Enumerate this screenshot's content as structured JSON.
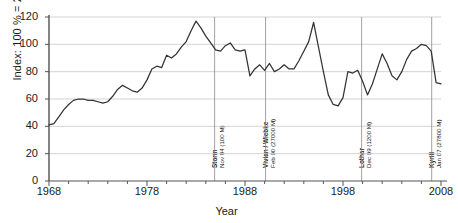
{
  "chart_data": {
    "type": "line",
    "title": "",
    "xlabel": "Year",
    "ylabel": "Index: 100 % = 2010",
    "xlim": [
      1968,
      2008
    ],
    "ylim": [
      0,
      120
    ],
    "grid": true,
    "legend": "none",
    "yticks": [
      0,
      20,
      40,
      60,
      80,
      100,
      120
    ],
    "xticks": [
      1968,
      1978,
      1988,
      1998,
      2008
    ],
    "x_minor_tick_step": 2,
    "series": [
      {
        "name": "Index",
        "x": [
          1968,
          1968.5,
          1969,
          1969.5,
          1970,
          1970.5,
          1971,
          1971.5,
          1972,
          1972.5,
          1973,
          1973.5,
          1974,
          1974.5,
          1975,
          1975.5,
          1976,
          1976.5,
          1977,
          1977.5,
          1978,
          1978.5,
          1979,
          1979.5,
          1980,
          1980.5,
          1981,
          1981.5,
          1982,
          1982.5,
          1983,
          1983.5,
          1984,
          1984.5,
          1985,
          1985.5,
          1986,
          1986.5,
          1987,
          1987.5,
          1988,
          1988.5,
          1989,
          1989.5,
          1990,
          1990.5,
          1991,
          1991.5,
          1992,
          1992.5,
          1993,
          1993.5,
          1994,
          1994.5,
          1995,
          1995.5,
          1996,
          1996.5,
          1997,
          1997.5,
          1998,
          1998.5,
          1999,
          1999.5,
          2000,
          2000.5,
          2001,
          2001.5,
          2002,
          2002.5,
          2003,
          2003.5,
          2004,
          2004.5,
          2005,
          2005.5,
          2006,
          2006.5,
          2007,
          2007.5,
          2008
        ],
        "y": [
          41,
          42,
          47,
          52,
          56,
          59,
          60,
          60,
          59,
          59,
          58,
          57,
          58,
          62,
          67,
          70,
          68,
          66,
          65,
          68,
          74,
          82,
          84,
          83,
          92,
          90,
          93,
          98,
          102,
          110,
          117,
          112,
          106,
          101,
          96,
          95,
          99,
          101,
          96,
          95,
          96,
          77,
          82,
          85,
          81,
          86,
          80,
          82,
          85,
          82,
          82,
          88,
          95,
          102,
          116,
          98,
          80,
          63,
          56,
          55,
          61,
          80,
          79,
          81,
          73,
          63,
          71,
          82,
          93,
          86,
          77,
          74,
          80,
          89,
          95,
          97,
          100,
          99,
          95,
          72,
          71
        ],
        "color": "#333333"
      }
    ],
    "annotations": [
      {
        "name": "Storm",
        "date_label": "Nov 84 (100 M)",
        "x": 1984.9
      },
      {
        "name": "Vivian / Wiebke",
        "date_label": "Feb 90 (27000 M)",
        "x": 1990.1
      },
      {
        "name": "Lothar",
        "date_label": "Dec 99 (1200 M)",
        "x": 1999.9
      },
      {
        "name": "Kyrill",
        "date_label": "Jan 07 (27800 M)",
        "x": 2007.05
      }
    ]
  }
}
